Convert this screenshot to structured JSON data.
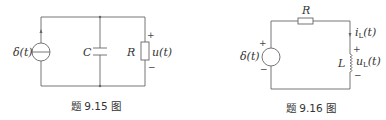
{
  "figures": [
    {
      "caption": "题 9.15 图",
      "components": {
        "source": {
          "type": "current-source",
          "label": "δ(t)"
        },
        "capacitor": {
          "label": "C"
        },
        "resistor": {
          "label": "R"
        },
        "voltage": {
          "label": "u(t)",
          "plus": "+",
          "minus": "−"
        }
      }
    },
    {
      "caption": "题 9.16 图",
      "components": {
        "source": {
          "type": "voltage-source",
          "label": "δ(t)",
          "plus": "+",
          "minus": "−"
        },
        "resistor": {
          "label": "R"
        },
        "inductor": {
          "label": "L"
        },
        "current": {
          "label": "i",
          "sub": "L",
          "arg": "(t)"
        },
        "voltage": {
          "label": "u",
          "sub": "L",
          "arg": "(t)",
          "plus": "+",
          "minus": "−"
        }
      }
    }
  ]
}
